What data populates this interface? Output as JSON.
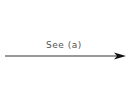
{
  "diagram": {
    "arrow": {
      "label": "See (a)",
      "direction": "right",
      "color": "#222222"
    }
  }
}
